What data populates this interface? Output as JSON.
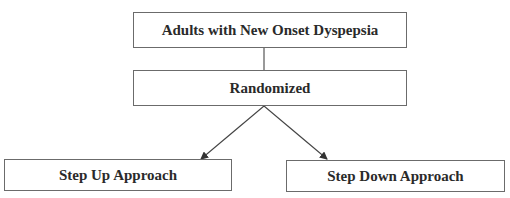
{
  "diagram": {
    "type": "flowchart",
    "nodes": [
      {
        "id": "population",
        "label": "Adults with New Onset Dyspepsia"
      },
      {
        "id": "randomized",
        "label": "Randomized"
      },
      {
        "id": "step_up",
        "label": "Step Up Approach"
      },
      {
        "id": "step_down",
        "label": "Step Down Approach"
      }
    ],
    "edges": [
      {
        "from": "population",
        "to": "randomized",
        "style": "line"
      },
      {
        "from": "randomized",
        "to": "step_up",
        "style": "arrow"
      },
      {
        "from": "randomized",
        "to": "step_down",
        "style": "arrow"
      }
    ]
  },
  "colors": {
    "stroke": "#6b6b6b",
    "text": "#2a2a2a",
    "background": "#ffffff"
  }
}
